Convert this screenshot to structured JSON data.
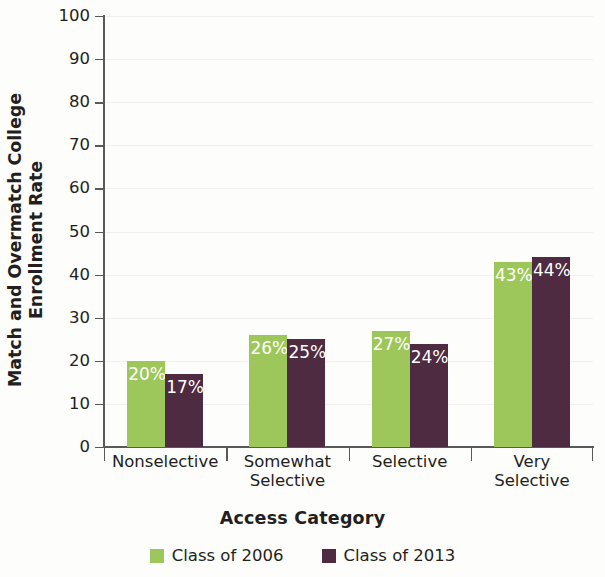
{
  "chart_data": {
    "type": "bar",
    "title": "",
    "xlabel": "Access Category",
    "ylabel": "Match and Overmatch College\nEnrollment Rate",
    "ylabel_line1": "Match and Overmatch College",
    "ylabel_line2": "Enrollment Rate",
    "categories": [
      "Nonselective",
      "Somewhat Selective",
      "Selective",
      "Very Selective"
    ],
    "category_lines": [
      [
        "Nonselective"
      ],
      [
        "Somewhat",
        "Selective"
      ],
      [
        "Selective"
      ],
      [
        "Very",
        "Selective"
      ]
    ],
    "series": [
      {
        "name": "Class of 2006",
        "color": "#9dc75a",
        "values": [
          20,
          26,
          27,
          43
        ],
        "labels": [
          "20%",
          "26%",
          "27%",
          "43%"
        ]
      },
      {
        "name": "Class of 2013",
        "color": "#4e2b41",
        "values": [
          17,
          25,
          24,
          44
        ],
        "labels": [
          "17%",
          "25%",
          "24%",
          "44%"
        ]
      }
    ],
    "ylim": [
      0,
      100
    ],
    "ytick_values": [
      0,
      10,
      20,
      30,
      40,
      50,
      60,
      70,
      80,
      90,
      100
    ],
    "ytick_labels": [
      "0",
      "10",
      "20",
      "30",
      "40",
      "50",
      "60",
      "70",
      "80",
      "90",
      "100"
    ],
    "grid": true,
    "grid_axis": "y",
    "legend_position": "bottom",
    "legend": [
      {
        "label": "Class of 2006",
        "color": "#9dc75a",
        "swatch": "legend-swatch-green"
      },
      {
        "label": "Class of 2013",
        "color": "#4e2b41",
        "swatch": "legend-swatch-purple"
      }
    ],
    "value_label_color": "#ffffff",
    "axis_color": "#58595b",
    "background_color": "#fdfdfb"
  }
}
